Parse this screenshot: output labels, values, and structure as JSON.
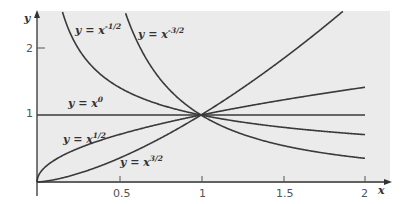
{
  "chart_data": {
    "type": "line",
    "title": "",
    "xlabel": "x",
    "ylabel": "y",
    "xlim": [
      0,
      2.1
    ],
    "ylim": [
      0,
      2.55
    ],
    "x_ticks": [
      "0.5",
      "1",
      "1.5",
      "2"
    ],
    "y_ticks": [
      "1",
      "2"
    ],
    "grid": false,
    "series": [
      {
        "name": "y = x^-1/2",
        "label_base": "y = x",
        "label_exp": "-1/2",
        "exponent": -0.5
      },
      {
        "name": "y = x^-3/2",
        "label_base": "y = x",
        "label_exp": "-3/2",
        "exponent": -1.5
      },
      {
        "name": "y = x^0",
        "label_base": "y = x",
        "label_exp": "0",
        "exponent": 0
      },
      {
        "name": "y = x^1/2",
        "label_base": "y = x",
        "label_exp": "1/2",
        "exponent": 0.5
      },
      {
        "name": "y = x^3/2",
        "label_base": "y = x",
        "label_exp": "3/2",
        "exponent": 1.5
      }
    ],
    "colors": {
      "panel": "#ebebeb",
      "curve": "#3a3a3a",
      "axis": "#333333"
    }
  }
}
